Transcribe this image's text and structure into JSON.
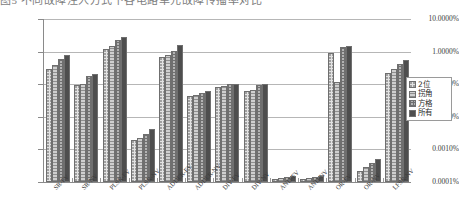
{
  "caption": {
    "text": "图5 不同故障注入方式下各电路单元故障传播率对比"
  },
  "legend": {
    "items": [
      {
        "label": "2位",
        "key": "series-0-key",
        "color": "#e2e2e2"
      },
      {
        "label": "拐角",
        "key": "series-1-key",
        "color": "#cfcfcf"
      },
      {
        "label": "方格",
        "key": "series-2-key",
        "color": "#b3b3b3"
      },
      {
        "label": "所有",
        "key": "series-3-key",
        "color": "#8f8f8f"
      }
    ]
  },
  "chart_data": {
    "type": "bar",
    "title": "",
    "xlabel": "",
    "ylabel": "",
    "yscale": "log",
    "ylim": [
      0.0001,
      10.0
    ],
    "ytick_labels": [
      "10.0000%",
      "1.0000%",
      "0.1000%",
      "0.0100%",
      "0.0010%",
      "0.0001%"
    ],
    "ytick_values": [
      10.0,
      1.0,
      0.1,
      0.01,
      0.001,
      0.0001
    ],
    "grid": true,
    "legend_position": "right",
    "categories": [
      "SR-FV",
      "SR-NV",
      "PLSR-FV",
      "PLSR-NV",
      "ADDER-FV",
      "ADDER-NV",
      "DIV-FV",
      "DIV-NV",
      "AND-FV",
      "AND-NV",
      "OR-FV",
      "OR-NV",
      "LFSR-NV"
    ],
    "series": [
      {
        "name": "2位",
        "values": [
          0.3,
          0.095,
          1.2,
          0.002,
          0.7,
          0.045,
          0.085,
          0.06,
          0.00012,
          0.00012,
          0.9,
          0.00022,
          0.22
        ]
      },
      {
        "name": "拐角",
        "values": [
          0.4,
          0.1,
          1.5,
          0.0022,
          0.8,
          0.048,
          0.09,
          0.065,
          0.00013,
          0.00013,
          0.12,
          0.00028,
          0.3
        ]
      },
      {
        "name": "方格",
        "values": [
          0.6,
          0.18,
          2.2,
          0.003,
          1.05,
          0.055,
          0.1,
          0.095,
          0.00014,
          0.00014,
          1.4,
          0.00038,
          0.42
        ]
      },
      {
        "name": "所有",
        "values": [
          0.8,
          0.2,
          2.8,
          0.0042,
          1.6,
          0.06,
          0.105,
          0.1,
          0.00015,
          0.00015,
          1.45,
          0.00052,
          0.55
        ]
      }
    ]
  }
}
